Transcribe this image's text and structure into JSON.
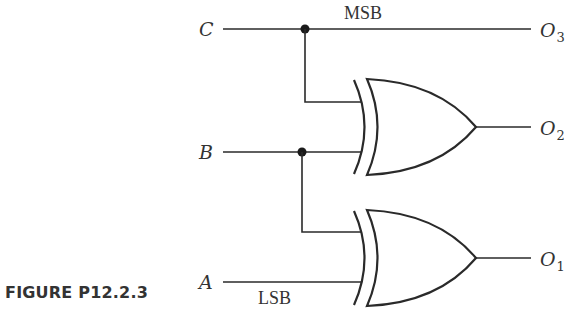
{
  "diagram": {
    "inputs": [
      {
        "name": "C",
        "label": "C",
        "note": "MSB"
      },
      {
        "name": "B",
        "label": "B",
        "note": ""
      },
      {
        "name": "A",
        "label": "A",
        "note": "LSB"
      }
    ],
    "outputs": [
      {
        "name": "O3",
        "base": "O",
        "sub": "3"
      },
      {
        "name": "O2",
        "base": "O",
        "sub": "2"
      },
      {
        "name": "O1",
        "base": "O",
        "sub": "1"
      }
    ],
    "gates": [
      {
        "type": "XOR",
        "inputs": [
          "C",
          "B"
        ],
        "output": "O2"
      },
      {
        "type": "XOR",
        "inputs": [
          "B",
          "A"
        ],
        "output": "O1"
      }
    ],
    "msb_label": "MSB",
    "lsb_label": "LSB"
  },
  "caption": "FIGURE P12.2.3"
}
